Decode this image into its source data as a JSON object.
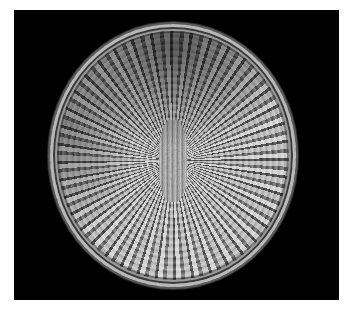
{
  "image": {
    "subject": "Woven coiled basket viewed from above",
    "background_color": "#000000",
    "border_color": "#ffffff",
    "palette": {
      "light_strands": "#e2e2e2",
      "mid_strands": "#8a8a8a",
      "dark_strands": "#4a4a4a"
    }
  }
}
